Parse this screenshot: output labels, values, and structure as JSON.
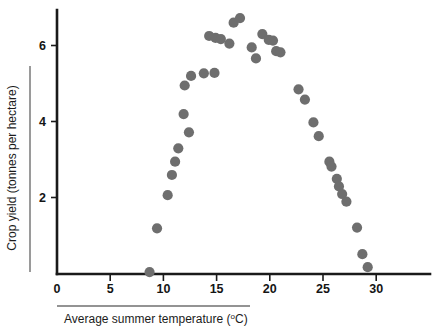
{
  "chart_data": {
    "type": "scatter",
    "title": "",
    "xlabel": "Average summer temperature (ºC)",
    "xlabel_main": "Average summer temperature (",
    "xlabel_unit_sup": "o",
    "xlabel_unit_rest": "C)",
    "ylabel": "Crop yield (tonnes per hectare)",
    "xlim": [
      0,
      33
    ],
    "ylim": [
      0,
      7.1
    ],
    "xticks": [
      0,
      5,
      10,
      15,
      20,
      25,
      30
    ],
    "xtick_labels": [
      "0",
      "5",
      "10",
      "15",
      "20",
      "25",
      "30"
    ],
    "yticks": [
      2,
      4,
      6
    ],
    "ytick_labels": [
      "2",
      "4",
      "6"
    ],
    "grid": false,
    "legend": "none",
    "marker_color": "#6e6e6e",
    "marker_size": 5.1,
    "axis_color": "#1a1a1a",
    "points": [
      {
        "x": 8.7,
        "y": 0.05
      },
      {
        "x": 9.4,
        "y": 1.2
      },
      {
        "x": 10.4,
        "y": 2.07
      },
      {
        "x": 10.8,
        "y": 2.6
      },
      {
        "x": 11.1,
        "y": 2.95
      },
      {
        "x": 11.4,
        "y": 3.3
      },
      {
        "x": 11.9,
        "y": 4.2
      },
      {
        "x": 12.4,
        "y": 3.72
      },
      {
        "x": 12.0,
        "y": 4.95
      },
      {
        "x": 12.6,
        "y": 5.2
      },
      {
        "x": 13.8,
        "y": 5.27
      },
      {
        "x": 14.8,
        "y": 5.28
      },
      {
        "x": 14.3,
        "y": 6.25
      },
      {
        "x": 14.9,
        "y": 6.2
      },
      {
        "x": 15.4,
        "y": 6.17
      },
      {
        "x": 16.2,
        "y": 6.05
      },
      {
        "x": 16.6,
        "y": 6.6
      },
      {
        "x": 17.2,
        "y": 6.72
      },
      {
        "x": 18.3,
        "y": 5.95
      },
      {
        "x": 18.7,
        "y": 5.66
      },
      {
        "x": 19.3,
        "y": 6.3
      },
      {
        "x": 19.9,
        "y": 6.15
      },
      {
        "x": 20.3,
        "y": 6.13
      },
      {
        "x": 20.6,
        "y": 5.85
      },
      {
        "x": 21.0,
        "y": 5.82
      },
      {
        "x": 22.7,
        "y": 4.85
      },
      {
        "x": 23.3,
        "y": 4.58
      },
      {
        "x": 24.1,
        "y": 3.98
      },
      {
        "x": 24.6,
        "y": 3.62
      },
      {
        "x": 25.6,
        "y": 2.95
      },
      {
        "x": 25.8,
        "y": 2.82
      },
      {
        "x": 26.3,
        "y": 2.5
      },
      {
        "x": 26.5,
        "y": 2.3
      },
      {
        "x": 26.8,
        "y": 2.1
      },
      {
        "x": 27.2,
        "y": 1.9
      },
      {
        "x": 28.2,
        "y": 1.22
      },
      {
        "x": 28.7,
        "y": 0.52
      },
      {
        "x": 29.2,
        "y": 0.18
      }
    ]
  }
}
